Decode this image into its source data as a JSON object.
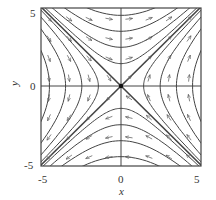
{
  "chart_data": {
    "type": "phase_portrait",
    "title": "",
    "xlabel": "x",
    "ylabel": "y",
    "xlim": [
      -5,
      5
    ],
    "ylim": [
      -5,
      5
    ],
    "xticks": [
      "-5",
      "0",
      "5"
    ],
    "yticks": [
      "-5",
      "0",
      "5"
    ],
    "grid": false,
    "system": {
      "dx_dt": "y",
      "dy_dt": "x"
    },
    "equilibrium": {
      "x": 0,
      "y": 0,
      "type": "saddle"
    },
    "separatrices": [
      {
        "name": "unstable manifold",
        "line": "y = x",
        "flow": "away from origin"
      },
      {
        "name": "stable manifold",
        "line": "y = -x",
        "flow": "toward origin"
      }
    ],
    "trajectories": "hyperbolas x^2 - y^2 = c",
    "level_values": [
      -20,
      -12,
      -6,
      -2,
      2,
      6,
      12,
      20
    ]
  },
  "labels": {
    "x_axis": "x",
    "y_axis": "y",
    "x_min": "-5",
    "x_zero": "0",
    "x_max": "5",
    "y_min": "-5",
    "y_zero": "0",
    "y_max": "5"
  }
}
